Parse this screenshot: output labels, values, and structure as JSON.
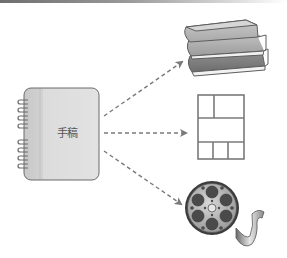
{
  "diagram": {
    "source": {
      "label": "手稿",
      "icon": "notebook-icon"
    },
    "targets": [
      {
        "icon": "books-icon"
      },
      {
        "icon": "page-layout-icon"
      },
      {
        "icon": "film-reel-icon"
      }
    ],
    "edges": [
      {
        "from": "source",
        "to": "books-icon",
        "style": "dashed-arrow"
      },
      {
        "from": "source",
        "to": "page-layout-icon",
        "style": "dashed-arrow"
      },
      {
        "from": "source",
        "to": "film-reel-icon",
        "style": "dashed-arrow"
      }
    ],
    "colors": {
      "arrow": "#7a7a7a",
      "notebook_fill": "#d9d9d9",
      "notebook_spine": "#c4c4c4",
      "outline": "#6a6a6a"
    }
  }
}
